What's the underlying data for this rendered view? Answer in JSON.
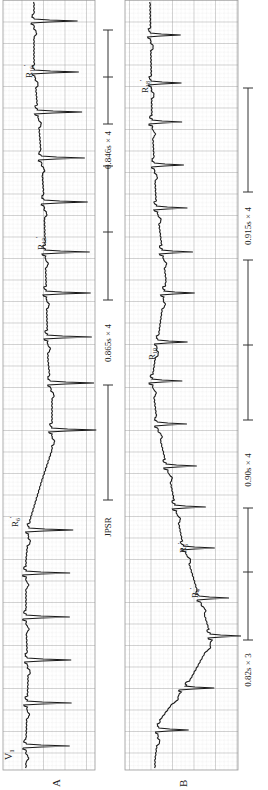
{
  "figure": {
    "panels": [
      {
        "id": "A",
        "label": "A",
        "lead": "V1",
        "lead_main": "V",
        "lead_sub": "1",
        "strip": {
          "x": 3,
          "y": 0,
          "w": 92,
          "h": 770
        },
        "baseline_x": 32,
        "spike_tip_x": 76,
        "spikes_y": [
          21,
          72,
          112,
          158,
          202,
          252,
          293,
          337,
          383,
          430,
          530,
          573,
          617,
          660,
          703,
          746
        ],
        "drift": [
          [
            0,
            34
          ],
          [
            60,
            34
          ],
          [
            90,
            36
          ],
          [
            140,
            40
          ],
          [
            200,
            44
          ],
          [
            280,
            46
          ],
          [
            360,
            48
          ],
          [
            400,
            52
          ],
          [
            450,
            52
          ],
          [
            480,
            42
          ],
          [
            520,
            30
          ],
          [
            560,
            26
          ],
          [
            620,
            26
          ],
          [
            680,
            28
          ],
          [
            740,
            26
          ],
          [
            770,
            26
          ]
        ],
        "beat_labels": [
          {
            "main": "R",
            "sub": "16",
            "prime": "'",
            "x": 24,
            "y": 78
          },
          {
            "main": "R",
            "sub": "12",
            "prime": "'",
            "x": 36,
            "y": 250
          },
          {
            "main": "R",
            "sub": "6",
            "prime": "'",
            "x": 10,
            "y": 527
          }
        ]
      },
      {
        "id": "B",
        "label": "B",
        "lead": "",
        "strip": {
          "x": 125,
          "y": 0,
          "w": 113,
          "h": 770
        },
        "baseline_x": 148,
        "spike_tip_x": 178,
        "spikes_y": [
          35,
          83,
          122,
          165,
          208,
          252,
          293,
          342,
          381,
          424,
          466,
          507,
          548,
          598,
          636,
          688,
          730
        ],
        "drift": [
          [
            0,
            150
          ],
          [
            120,
            152
          ],
          [
            200,
            156
          ],
          [
            280,
            166
          ],
          [
            340,
            158
          ],
          [
            380,
            152
          ],
          [
            430,
            158
          ],
          [
            480,
            170
          ],
          [
            540,
            182
          ],
          [
            600,
            200
          ],
          [
            640,
            212
          ],
          [
            680,
            190
          ],
          [
            720,
            160
          ],
          [
            760,
            155
          ],
          [
            770,
            155
          ]
        ],
        "beat_labels": [
          {
            "main": "R",
            "sub": "18",
            "prime": "'",
            "x": 140,
            "y": 93
          },
          {
            "main": "R",
            "sub": "10",
            "prime": "",
            "x": 147,
            "y": 360
          },
          {
            "main": "R",
            "sub": "5",
            "prime": "'",
            "x": 178,
            "y": 553
          },
          {
            "main": "R",
            "sub": "4",
            "prime": "'",
            "x": 190,
            "y": 598
          }
        ]
      }
    ],
    "annotations_A": {
      "x": 108,
      "segments": [
        {
          "type": "bar",
          "y1": 30,
          "y2": 124,
          "text": "",
          "tick": [
            77
          ]
        },
        {
          "type": "text",
          "text": "0.846s × 4",
          "y": 150
        },
        {
          "type": "bar",
          "y1": 166,
          "y2": 300,
          "tick": [
            232
          ]
        },
        {
          "type": "text",
          "text": "0.865s × 4",
          "y": 343
        },
        {
          "type": "bar",
          "y1": 385,
          "y2": 500,
          "tick": []
        },
        {
          "type": "text",
          "text": "JPSR",
          "y": 527
        }
      ]
    },
    "annotations_B": {
      "x": 248,
      "segments": [
        {
          "type": "bar",
          "y1": 88,
          "y2": 192,
          "tick": []
        },
        {
          "type": "text",
          "text": "0.915s × 4",
          "y": 226
        },
        {
          "type": "bar",
          "y1": 260,
          "y2": 420,
          "tick": [
            345
          ]
        },
        {
          "type": "text",
          "text": "0.90s × 4",
          "y": 470
        },
        {
          "type": "bar",
          "y1": 508,
          "y2": 640,
          "tick": [
            572
          ]
        },
        {
          "type": "text",
          "text": "0.82s × 3",
          "y": 670
        }
      ]
    },
    "colors": {
      "grid_major": "#9a9a9a",
      "grid_minor": "#c8c8c8",
      "trace": "#1a1a1a",
      "text": "#222222"
    }
  }
}
